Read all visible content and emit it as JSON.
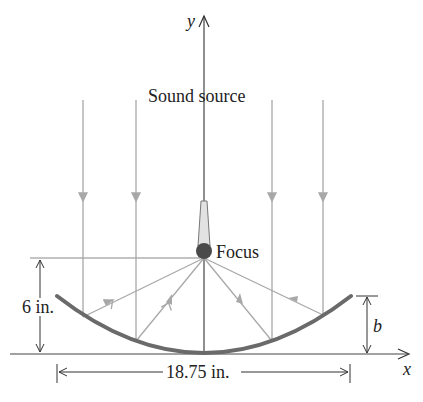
{
  "diagram": {
    "type": "parabolic reflector cross-section",
    "labels": {
      "y_axis": "y",
      "x_axis": "x",
      "sound_source": "Sound source",
      "focus": "Focus",
      "depth": "6 in.",
      "width": "18.75 in.",
      "rim_height": "b"
    },
    "colors": {
      "dish": "#6a6a6a",
      "rays": "#a8a8a8",
      "axes": "#333333",
      "focus_ball": "#4a4a4a",
      "mic_body": "#e2e2e2"
    }
  }
}
